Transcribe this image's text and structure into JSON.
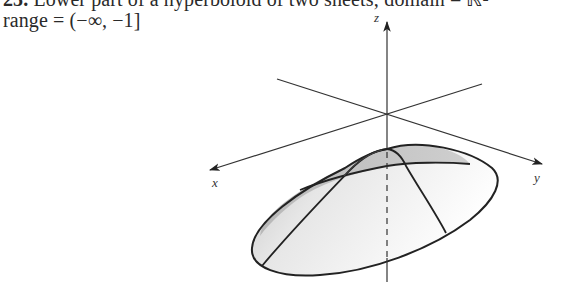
{
  "caption": {
    "number": "25.",
    "line1_text": "Lower part of a hyperboloid of two sheets; domain = ℝ²",
    "line2_text": "range = (−∞, −1]"
  },
  "figure": {
    "type": "3d-surface-sketch",
    "axes": {
      "x_label": "x",
      "y_label": "y",
      "z_label": "z"
    },
    "colors": {
      "line": "#222222",
      "shade_dark": "#bdbdbd",
      "shade_light": "#ececec",
      "background": "#ffffff"
    }
  }
}
